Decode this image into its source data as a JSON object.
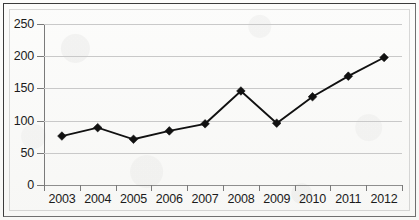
{
  "chart_data": {
    "type": "line",
    "title": "",
    "xlabel": "",
    "ylabel": "",
    "categories": [
      "2003",
      "2004",
      "2005",
      "2006",
      "2007",
      "2008",
      "2009",
      "2010",
      "2011",
      "2012"
    ],
    "values": [
      76,
      89,
      71,
      84,
      95,
      146,
      96,
      137,
      169,
      198
    ],
    "series": [
      {
        "name": "series-1",
        "values": [
          76,
          89,
          71,
          84,
          95,
          146,
          96,
          137,
          169,
          198
        ],
        "marker": "diamond",
        "color": "#111111"
      }
    ],
    "ylim": [
      0,
      250
    ],
    "yticks": [
      0,
      50,
      100,
      150,
      200,
      250
    ],
    "ytick_labels": [
      "0",
      "50",
      "100",
      "150",
      "200",
      "250"
    ],
    "xtick_labels": [
      "2003",
      "2004",
      "2005",
      "2006",
      "2007",
      "2008",
      "2009",
      "2010",
      "2011",
      "2012"
    ],
    "grid": true,
    "grid_axis": "y",
    "legend": false,
    "legend_position": "none",
    "annotations": []
  },
  "figure": {
    "background_color": "#fbfbfa",
    "frame_color": "#4a4a4a",
    "grid_color": "#c9c9c9",
    "axis_color": "#7a7a7a",
    "text_color": "#1b1b1b"
  }
}
